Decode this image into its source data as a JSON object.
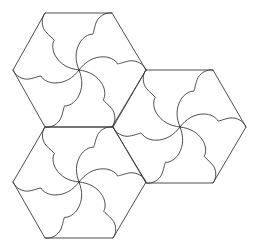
{
  "diagram": {
    "title": "",
    "stroke_color": "#3a3a3a",
    "background_color": "#ffffff",
    "curve_local_path": "M0,0 C2,6 10,10 16,9 C22,8 26,6 28,6 C30,10 36,13 42,13 C52,13 60,8 66,0",
    "curve_local_length": 66,
    "hexagons": [
      {
        "id": "top",
        "center": [
          79,
          70
        ],
        "vertices": [
          [
            45,
            13
          ],
          [
            112,
            13
          ],
          [
            146,
            70
          ],
          [
            112,
            127
          ],
          [
            45,
            127
          ],
          [
            13,
            70
          ]
        ]
      },
      {
        "id": "right",
        "center": [
          180,
          127
        ],
        "vertices": [
          [
            146,
            70
          ],
          [
            213,
            70
          ],
          [
            246,
            127
          ],
          [
            213,
            183
          ],
          [
            146,
            183
          ],
          [
            113,
            127
          ]
        ]
      },
      {
        "id": "bottom-left",
        "center": [
          79,
          182
        ],
        "vertices": [
          [
            45,
            127
          ],
          [
            113,
            127
          ],
          [
            146,
            182
          ],
          [
            113,
            238
          ],
          [
            45,
            238
          ],
          [
            13,
            182
          ]
        ]
      }
    ]
  }
}
